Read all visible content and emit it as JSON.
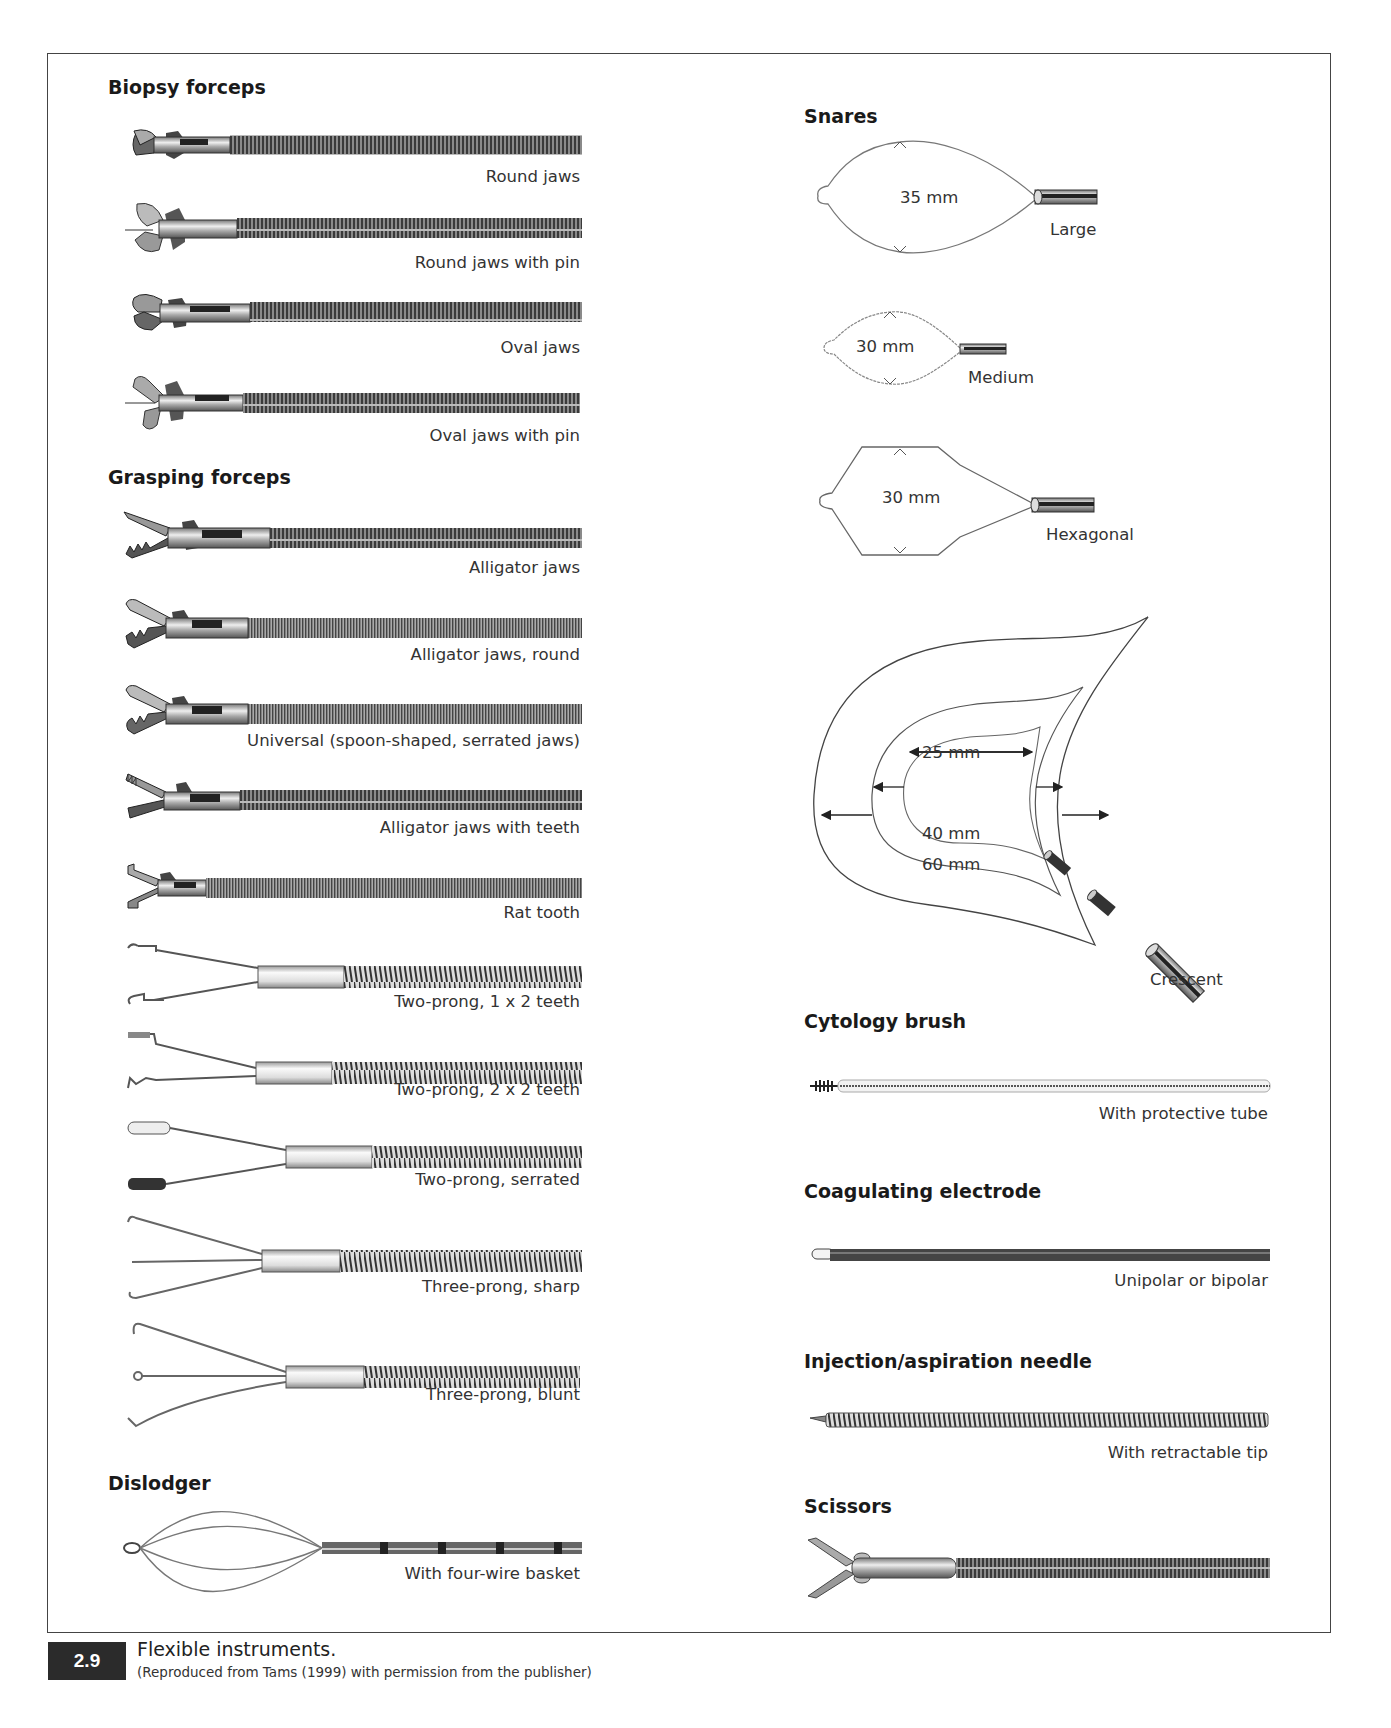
{
  "figure": {
    "number": "2.9",
    "caption": "Flexible instruments.",
    "credit": "(Reproduced from Tams (1999) with permission from the publisher)"
  },
  "left_column": {
    "biopsy": {
      "heading": "Biopsy forceps",
      "items": [
        {
          "label": "Round jaws",
          "icon": "round-jaw-forceps"
        },
        {
          "label": "Round jaws with pin",
          "icon": "round-jaw-pin-forceps"
        },
        {
          "label": "Oval jaws",
          "icon": "oval-jaw-forceps"
        },
        {
          "label": "Oval jaws with pin",
          "icon": "oval-jaw-pin-forceps"
        }
      ]
    },
    "grasping": {
      "heading": "Grasping forceps",
      "items": [
        {
          "label": "Alligator jaws",
          "icon": "alligator-jaw-forceps"
        },
        {
          "label": "Alligator jaws, round",
          "icon": "alligator-round-forceps"
        },
        {
          "label": "Universal (spoon-shaped, serrated jaws)",
          "icon": "universal-forceps"
        },
        {
          "label": "Alligator jaws with teeth",
          "icon": "alligator-teeth-forceps"
        },
        {
          "label": "Rat tooth",
          "icon": "rat-tooth-forceps"
        },
        {
          "label": "Two-prong, 1 x 2 teeth",
          "icon": "two-prong-1x2"
        },
        {
          "label": "Two-prong, 2 x 2 teeth",
          "icon": "two-prong-2x2"
        },
        {
          "label": "Two-prong, serrated",
          "icon": "two-prong-serrated"
        },
        {
          "label": "Three-prong, sharp",
          "icon": "three-prong-sharp"
        },
        {
          "label": "Three-prong, blunt",
          "icon": "three-prong-blunt"
        }
      ]
    },
    "dislodger": {
      "heading": "Dislodger",
      "items": [
        {
          "label": "With four-wire basket",
          "icon": "four-wire-basket"
        }
      ]
    }
  },
  "right_column": {
    "snares": {
      "heading": "Snares",
      "items": [
        {
          "label": "Large",
          "size": "35 mm",
          "icon": "oval-snare-large"
        },
        {
          "label": "Medium",
          "size": "30 mm",
          "icon": "oval-snare-medium"
        },
        {
          "label": "Hexagonal",
          "size": "30 mm",
          "icon": "hexagonal-snare"
        },
        {
          "label": "Crescent",
          "sizes": [
            "25 mm",
            "40 mm",
            "60 mm"
          ],
          "icon": "crescent-snare"
        }
      ]
    },
    "cytology": {
      "heading": "Cytology brush",
      "items": [
        {
          "label": "With protective tube",
          "icon": "cytology-brush"
        }
      ]
    },
    "coagulating": {
      "heading": "Coagulating electrode",
      "items": [
        {
          "label": "Unipolar or bipolar",
          "icon": "coagulating-electrode"
        }
      ]
    },
    "injection": {
      "heading": "Injection/aspiration needle",
      "items": [
        {
          "label": "With retractable tip",
          "icon": "injection-needle"
        }
      ]
    },
    "scissors": {
      "heading": "Scissors",
      "items": []
    }
  },
  "colors": {
    "ink": "#222222",
    "coil": "#555555",
    "frame": "#444444",
    "badge": "#2b2b2b"
  }
}
